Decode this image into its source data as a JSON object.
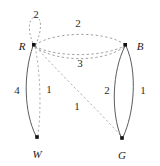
{
  "figure": {
    "type": "weighted-multigraph",
    "background_color": "#ffffff",
    "stroke_color": "#3a3a3a",
    "dashed_stroke_color": "#777777",
    "text_color": "#1a1a1a",
    "width": 160,
    "height": 166
  },
  "nodes": [
    {
      "id": "R",
      "label": "R",
      "x": 34,
      "y": 45,
      "label_x": 22,
      "label_y": 46
    },
    {
      "id": "B",
      "label": "B",
      "x": 125,
      "y": 45,
      "label_x": 140,
      "label_y": 46
    },
    {
      "id": "W",
      "label": "W",
      "x": 37,
      "y": 137,
      "label_x": 37,
      "label_y": 154
    },
    {
      "id": "G",
      "label": "G",
      "x": 122,
      "y": 138,
      "label_x": 122,
      "label_y": 155
    }
  ],
  "edges": [
    {
      "id": "R-R-loop",
      "from": "R",
      "to": "R",
      "weight": "2",
      "style": "dashed",
      "label_x": 36,
      "label_y": 14
    },
    {
      "id": "R-B-upper",
      "from": "R",
      "to": "B",
      "weight": "2",
      "style": "dashed",
      "label_x": 78,
      "label_y": 23
    },
    {
      "id": "R-B-lower",
      "from": "R",
      "to": "B",
      "weight": "",
      "style": "dashed",
      "label_x": 0,
      "label_y": 0
    },
    {
      "id": "R-B-third",
      "from": "R",
      "to": "B",
      "weight": "3",
      "style": "dashed",
      "label_x": 80,
      "label_y": 63
    },
    {
      "id": "R-W-solid",
      "from": "R",
      "to": "W",
      "weight": "4",
      "style": "solid",
      "label_x": 17,
      "label_y": 90
    },
    {
      "id": "R-W-dashed",
      "from": "R",
      "to": "W",
      "weight": "1",
      "style": "dashed",
      "label_x": 49,
      "label_y": 89
    },
    {
      "id": "R-G-dashed",
      "from": "R",
      "to": "G",
      "weight": "1",
      "style": "dashed",
      "label_x": 77,
      "label_y": 106
    },
    {
      "id": "B-G-left",
      "from": "B",
      "to": "G",
      "weight": "2",
      "style": "solid",
      "label_x": 107,
      "label_y": 90
    },
    {
      "id": "B-G-right",
      "from": "B",
      "to": "G",
      "weight": "1",
      "style": "solid",
      "label_x": 143,
      "label_y": 90
    }
  ],
  "weights_listing": [
    "2",
    "2",
    "3",
    "4",
    "1",
    "1",
    "2",
    "1"
  ]
}
